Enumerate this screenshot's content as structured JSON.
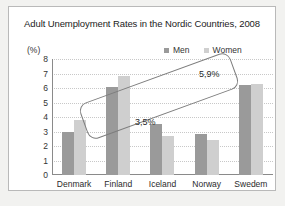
{
  "chart_data": {
    "type": "bar",
    "title": "Adult Unemployment Rates in the Nordic Countries, 2008",
    "xlabel": "",
    "ylabel": "(%)",
    "ylim": [
      0,
      8
    ],
    "yticks": [
      "8",
      "7",
      "6",
      "5",
      "4",
      "3",
      "2",
      "1",
      "0"
    ],
    "grid": true,
    "legend_position": "top-right",
    "categories": [
      "Denmark",
      "Finland",
      "Iceland",
      "Norway",
      "Swedem"
    ],
    "series": [
      {
        "name": "Men",
        "color": "#9a9a9a",
        "values": [
          3.0,
          6.1,
          3.5,
          2.85,
          6.2
        ]
      },
      {
        "name": "Women",
        "color": "#cfcfcf",
        "values": [
          3.8,
          6.8,
          2.7,
          2.4,
          6.3
        ]
      }
    ],
    "annotations": [
      {
        "text": "3,5%"
      },
      {
        "text": "5,9%"
      }
    ],
    "annotation_shape": "rotated-rounded-rectangle"
  },
  "figure": {
    "background_color": "#f2f2f0",
    "panel_color": "#ffffff",
    "panel_border_color": "#b9b9b9"
  }
}
